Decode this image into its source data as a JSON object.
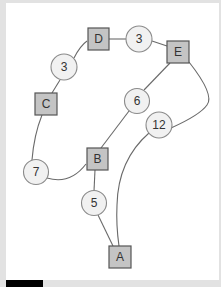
{
  "diagram": {
    "type": "weighted-graph",
    "nodes": [
      {
        "id": "A",
        "label": "A",
        "shape": "square",
        "cx": 120,
        "cy": 257
      },
      {
        "id": "B",
        "label": "B",
        "shape": "square",
        "cx": 97,
        "cy": 159
      },
      {
        "id": "C",
        "label": "C",
        "shape": "square",
        "cx": 46,
        "cy": 104
      },
      {
        "id": "D",
        "label": "D",
        "shape": "square",
        "cx": 98,
        "cy": 39
      },
      {
        "id": "E",
        "label": "E",
        "shape": "square",
        "cx": 178,
        "cy": 52
      }
    ],
    "edges": [
      {
        "from": "D",
        "to": "E",
        "weight": "3",
        "wx": 139,
        "wy": 39
      },
      {
        "from": "D",
        "to": "C",
        "weight": "3",
        "wx": 64,
        "wy": 67
      },
      {
        "from": "C",
        "to": "B",
        "weight": "7",
        "wx": 36,
        "wy": 172
      },
      {
        "from": "B",
        "to": "E",
        "weight": "6",
        "wx": 137,
        "wy": 101
      },
      {
        "from": "E",
        "to": "A",
        "weight": "12",
        "wx": 159,
        "wy": 124
      },
      {
        "from": "B",
        "to": "A",
        "weight": "5",
        "wx": 94,
        "wy": 203
      }
    ]
  },
  "labels": {
    "node_A": "A",
    "node_B": "B",
    "node_C": "C",
    "node_D": "D",
    "node_E": "E",
    "w_DE": "3",
    "w_DC": "3",
    "w_CB": "7",
    "w_BE": "6",
    "w_EA": "12",
    "w_BA": "5"
  },
  "colors": {
    "background": "#ffffff",
    "frame": "#e2e2e2",
    "square_fill": "#c4c4c4",
    "circle_fill": "#f1f1f1",
    "edge": "#6a6a6a"
  }
}
